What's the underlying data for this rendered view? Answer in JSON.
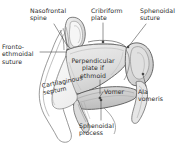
{
  "figure": {
    "name": "nasal-septum-sagittal-diagram",
    "background_color": "#ffffff",
    "line_color": "#3a3a3a",
    "shade_light": "#e3e3e3",
    "shade_mid": "#cfcfcf",
    "shade_dark": "#b5b5b5",
    "text_color": "#2b2b2b"
  },
  "labels": {
    "nasofrontal_spine": "Nasofrontal\nspine",
    "cribriform_plate": "Cribriform\nplate",
    "sphenoidal_suture": "Sphenoidal\nsuture",
    "fronto_ethmoidal_suture": "Fronto-\nethmoidal\nsuture",
    "perpendicular_plate_of_ethmoid": "Perpendicular\nplate if\nethmoid",
    "cartilaginous_septum": "Cartilaginous\nseptum",
    "vomer": "Vomer",
    "ala_vomeris": "Ala\nvomeris",
    "sphenoidal_process": "Sphenoidal\nprocess"
  },
  "leader_lines": [
    {
      "name": "leader-nasofrontal-spine",
      "from": [
        54,
        24
      ],
      "to": [
        68,
        44
      ]
    },
    {
      "name": "leader-cribriform-plate",
      "from": [
        103,
        22
      ],
      "to": [
        103,
        42
      ]
    },
    {
      "name": "leader-sphenoidal-suture",
      "from": [
        144,
        24
      ],
      "to": [
        128,
        46
      ]
    },
    {
      "name": "leader-fronto-ethmoidal-suture",
      "from": [
        41,
        52
      ],
      "to": [
        61,
        52
      ]
    },
    {
      "name": "leader-vomer",
      "from": [
        100,
        96
      ],
      "to": [
        92,
        100
      ]
    },
    {
      "name": "leader-ala-vomeris",
      "from": [
        146,
        86
      ],
      "to": [
        143,
        74
      ]
    },
    {
      "name": "leader-sphenoidal-process",
      "from": [
        101,
        120
      ],
      "to": [
        101,
        100
      ]
    },
    {
      "name": "leader-perpendicular-plate",
      "from": [
        100,
        80
      ],
      "to": [
        100,
        92
      ]
    }
  ]
}
